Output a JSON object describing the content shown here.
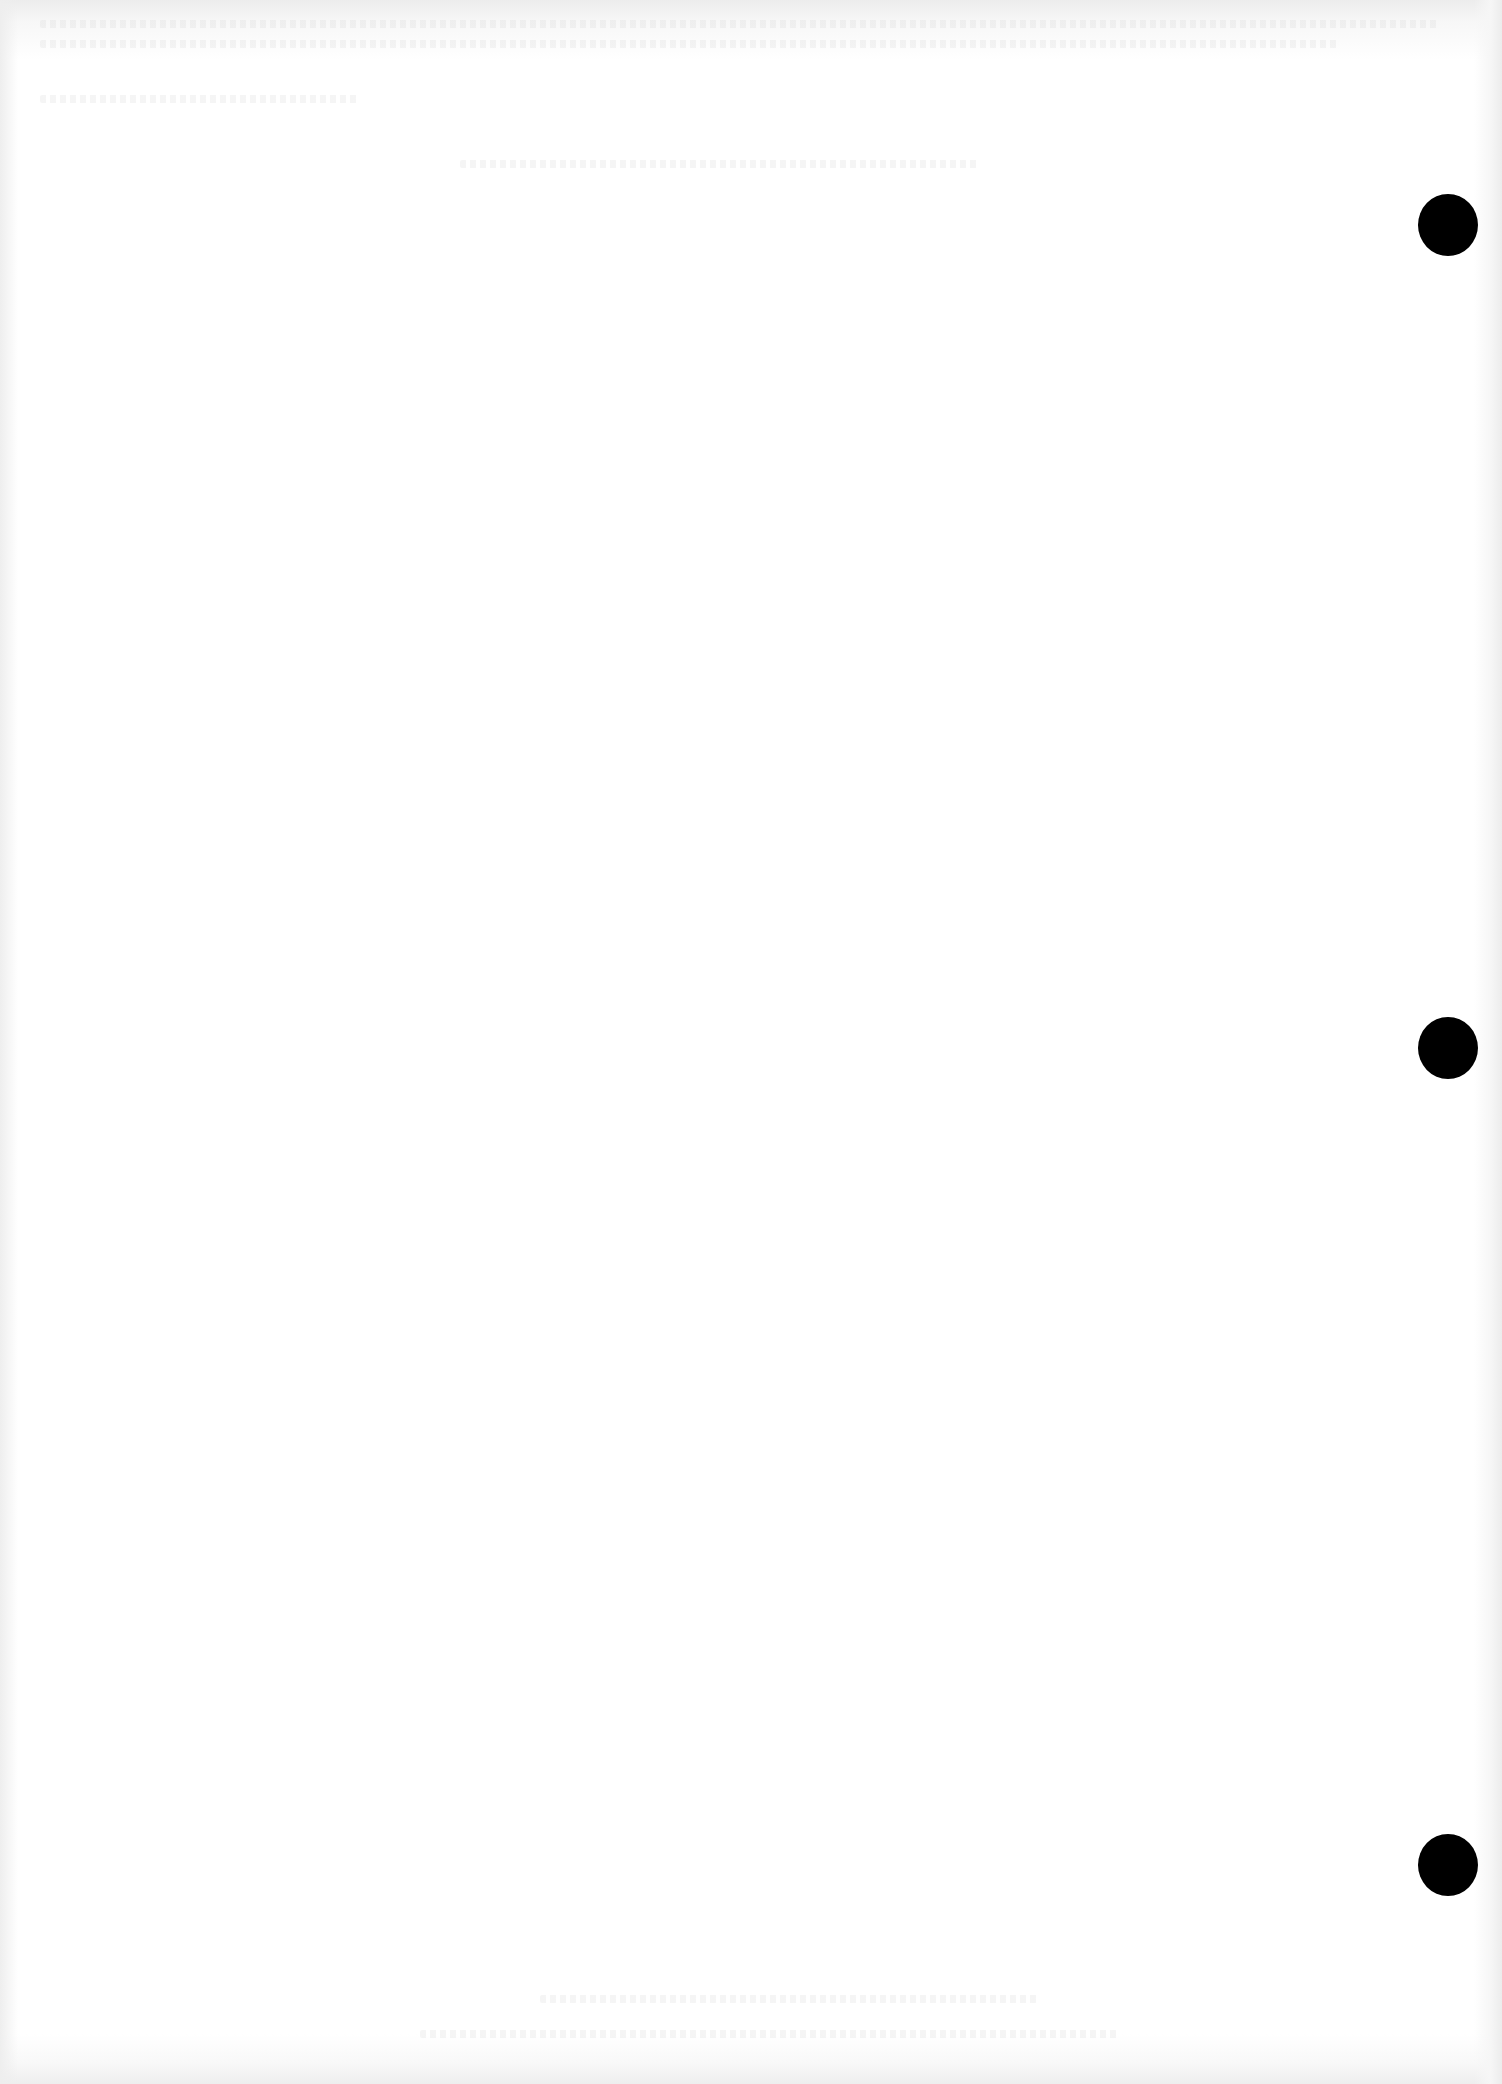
{
  "document": {
    "type": "blank scanned page",
    "text_content": "",
    "background_color": "#ffffff",
    "edge_shade_color": "#ececec",
    "punch_holes": [
      {
        "label": "top",
        "x": 1418,
        "y": 194,
        "color": "#000000"
      },
      {
        "label": "middle",
        "x": 1418,
        "y": 1017,
        "color": "#000000"
      },
      {
        "label": "bottom",
        "x": 1418,
        "y": 1834,
        "color": "#000000"
      }
    ],
    "show_through_regions": [
      {
        "x": 40,
        "y": 20,
        "w": 1400,
        "h": 8
      },
      {
        "x": 40,
        "y": 40,
        "w": 1300,
        "h": 8
      },
      {
        "x": 40,
        "y": 95,
        "w": 320,
        "h": 8
      },
      {
        "x": 460,
        "y": 160,
        "w": 520,
        "h": 8
      },
      {
        "x": 540,
        "y": 1995,
        "w": 500,
        "h": 8
      },
      {
        "x": 420,
        "y": 2030,
        "w": 700,
        "h": 8
      }
    ]
  }
}
